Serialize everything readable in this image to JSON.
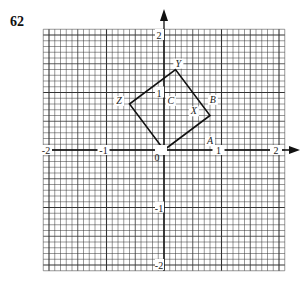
{
  "figure": {
    "number": "62",
    "grid": {
      "x_range": [
        -2.1,
        2.1
      ],
      "y_range": [
        -2.1,
        2.1
      ],
      "minor_per_unit": 10,
      "line_color": "#333333"
    },
    "axes": {
      "x_ticks": [
        {
          "value": -2,
          "label": "-2"
        },
        {
          "value": -1,
          "label": "-1"
        },
        {
          "value": 0,
          "label": "0"
        },
        {
          "value": 1,
          "label": "1"
        },
        {
          "value": 2,
          "label": "2"
        }
      ],
      "y_ticks": [
        {
          "value": 2,
          "label": "2"
        },
        {
          "value": 1,
          "label": "1"
        },
        {
          "value": -1,
          "label": "-1"
        },
        {
          "value": -2,
          "label": "-2"
        }
      ]
    },
    "square": {
      "vertices": [
        [
          0,
          0
        ],
        [
          0.8,
          0.6
        ],
        [
          0.2,
          1.4
        ],
        [
          -0.6,
          0.8
        ]
      ],
      "color": "#111111"
    },
    "labels": [
      {
        "text": "Y",
        "x": 0.25,
        "y": 1.45
      },
      {
        "text": "Z",
        "x": -0.78,
        "y": 0.8
      },
      {
        "text": "C",
        "x": 0.12,
        "y": 0.8
      },
      {
        "text": "B",
        "x": 0.85,
        "y": 0.82
      },
      {
        "text": "X",
        "x": 0.52,
        "y": 0.62
      },
      {
        "text": "A",
        "x": 0.8,
        "y": 0.1
      }
    ]
  }
}
